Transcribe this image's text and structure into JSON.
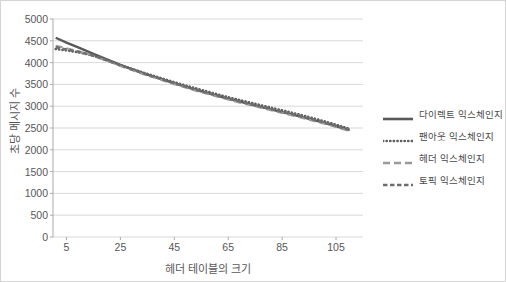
{
  "chart_data": {
    "type": "line",
    "title": "",
    "xlabel": "헤더 테이블의 크기",
    "ylabel": "초당 메시지 수",
    "xlim": [
      0,
      115
    ],
    "ylim": [
      0,
      5000
    ],
    "grid": true,
    "legend_position": "right",
    "xticks": [
      "5",
      "25",
      "45",
      "65",
      "85",
      "105"
    ],
    "xtick_values": [
      5,
      25,
      45,
      65,
      85,
      105
    ],
    "yticks": [
      "0",
      "500",
      "1000",
      "1500",
      "2000",
      "2500",
      "3000",
      "3500",
      "4000",
      "4500",
      "5000"
    ],
    "ytick_values": [
      0,
      500,
      1000,
      1500,
      2000,
      2500,
      3000,
      3500,
      4000,
      4500,
      5000
    ],
    "x": [
      1,
      5,
      10,
      15,
      20,
      25,
      30,
      35,
      40,
      45,
      50,
      55,
      60,
      65,
      70,
      75,
      80,
      85,
      90,
      95,
      100,
      105,
      110
    ],
    "series": [
      {
        "name": "다이렉트 익스체인지",
        "style": "solid",
        "color": "#595959",
        "values": [
          4570,
          4460,
          4330,
          4200,
          4075,
          3950,
          3835,
          3725,
          3625,
          3525,
          3430,
          3340,
          3255,
          3170,
          3095,
          3015,
          2940,
          2865,
          2790,
          2710,
          2630,
          2540,
          2450
        ]
      },
      {
        "name": "팬아웃 익스체인지",
        "style": "dotted",
        "color": "#5e5e5e",
        "values": [
          4310,
          4280,
          4230,
          4160,
          4050,
          3945,
          3840,
          3740,
          3645,
          3550,
          3460,
          3375,
          3290,
          3205,
          3130,
          3055,
          2980,
          2905,
          2830,
          2750,
          2665,
          2575,
          2480
        ]
      },
      {
        "name": "헤더 익스체인지",
        "style": "dashed-long",
        "color": "#9a9a9a",
        "values": [
          4390,
          4330,
          4250,
          4150,
          4040,
          3920,
          3810,
          3705,
          3605,
          3505,
          3410,
          3320,
          3235,
          3150,
          3070,
          2995,
          2920,
          2845,
          2770,
          2690,
          2610,
          2520,
          2430
        ]
      },
      {
        "name": "토픽 익스체인지",
        "style": "dashed-med",
        "color": "#6e6e6e",
        "values": [
          4350,
          4300,
          4240,
          4160,
          4055,
          3940,
          3830,
          3725,
          3625,
          3525,
          3435,
          3345,
          3260,
          3180,
          3100,
          3025,
          2950,
          2875,
          2800,
          2720,
          2640,
          2550,
          2460
        ]
      }
    ]
  },
  "axes": {
    "y_title": "초당 메시지 수",
    "x_title": "헤더 테이블의 크기"
  },
  "legend": {
    "items": [
      {
        "label": "다이렉트 익스체인지"
      },
      {
        "label": "팬아웃 익스체인지"
      },
      {
        "label": "헤더 익스체인지"
      },
      {
        "label": "토픽 익스체인지"
      }
    ]
  },
  "colors": {
    "gridline": "#d9d9d9",
    "axis": "#aaaaaa",
    "tick_text": "#575757",
    "border": "#d4d4d4"
  }
}
